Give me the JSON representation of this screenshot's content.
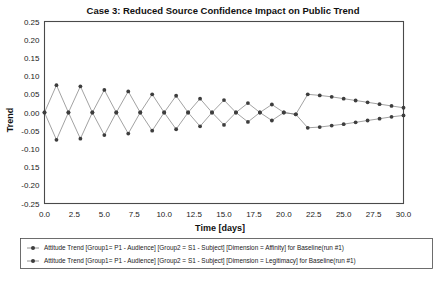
{
  "chart_data": {
    "type": "line",
    "title": "Case 3: Reduced Source Confidence Impact on Public Trend",
    "xlabel": "Time [days]",
    "ylabel": "Trend",
    "xlim": [
      0.0,
      30.0
    ],
    "ylim": [
      -0.25,
      0.25
    ],
    "grid": true,
    "legend_position": "below",
    "xticks": [
      "0.0",
      "2.5",
      "5.0",
      "7.5",
      "10.0",
      "12.5",
      "15.0",
      "17.5",
      "20.0",
      "22.5",
      "25.0",
      "27.5",
      "30.0"
    ],
    "xtick_values": [
      0.0,
      2.5,
      5.0,
      7.5,
      10.0,
      12.5,
      15.0,
      17.5,
      20.0,
      22.5,
      25.0,
      27.5,
      30.0
    ],
    "yticks": [
      "0.25",
      "0.20",
      "0.15",
      "0.10",
      "0.05",
      "0.00",
      "-0.05",
      "-0.10",
      "0.15",
      "-0.20",
      "-0.25"
    ],
    "ytick_values": [
      0.25,
      0.2,
      0.15,
      0.1,
      0.05,
      0.0,
      -0.05,
      -0.1,
      -0.15,
      -0.2,
      -0.25
    ],
    "x": [
      0,
      1,
      2,
      3,
      4,
      5,
      6,
      7,
      8,
      9,
      10,
      11,
      12,
      13,
      14,
      15,
      16,
      17,
      18,
      19,
      20,
      21,
      22,
      23,
      24,
      25,
      26,
      27,
      28,
      29,
      30
    ],
    "series": [
      {
        "name": "Attitude Trend [Group1= P1 - Audience] [Group2 = S1 - Subject] [Dimension = Affinity] for Baseline(run #1)",
        "marker": "circle",
        "values": [
          0.0,
          0.075,
          0.0,
          -0.072,
          0.0,
          0.062,
          0.0,
          -0.058,
          0.0,
          0.05,
          0.0,
          -0.046,
          0.0,
          0.038,
          0.0,
          -0.034,
          0.0,
          0.026,
          0.0,
          -0.022,
          0.0,
          -0.005,
          0.05,
          0.047,
          0.043,
          0.038,
          0.033,
          0.028,
          0.023,
          0.018,
          0.013
        ]
      },
      {
        "name": "Attitude Trend [Group1= P1 - Audience] [Group2 = S1 - Subject] [Dimension = Legitimacy] for Baseline(run #1)",
        "marker": "circle",
        "values": [
          0.0,
          -0.075,
          0.0,
          0.072,
          0.0,
          -0.062,
          0.0,
          0.058,
          0.0,
          -0.05,
          0.0,
          0.046,
          0.0,
          -0.038,
          0.0,
          0.034,
          0.0,
          -0.026,
          0.0,
          0.022,
          0.0,
          -0.005,
          -0.042,
          -0.04,
          -0.036,
          -0.032,
          -0.027,
          -0.022,
          -0.017,
          -0.012,
          -0.008
        ]
      }
    ]
  },
  "colors": {
    "line": "#7a7a7a",
    "marker": "#3d3d3d",
    "frame": "#4a4a4a",
    "grid": "#cccccc",
    "background": "#ffffff"
  }
}
